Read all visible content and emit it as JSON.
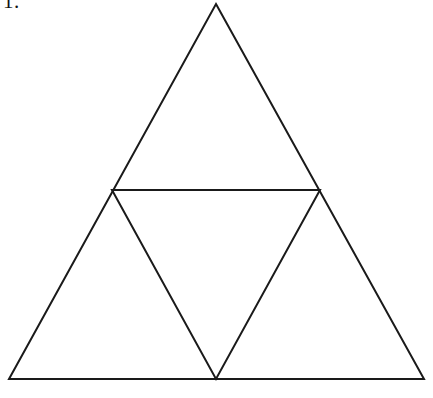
{
  "page": {
    "background_color": "#ffffff",
    "width": 433,
    "height": 398
  },
  "problem": {
    "number_label": "1."
  },
  "figure": {
    "caption": "",
    "stroke_color": "#1a1a1a",
    "fill_color": "none",
    "stroke_width": 2,
    "shapes": {
      "outer_triangle": {
        "name": "outer-triangle",
        "points": "216,4 424,379 9,379",
        "vertices": {
          "apex": "216,4",
          "bottom_left": "9,379",
          "bottom_right": "424,379"
        }
      },
      "inner_triangle": {
        "name": "inner-inverted-triangle",
        "points": "112,190 320,190 216,379",
        "vertices": {
          "top_left_midpoint": "112,190",
          "top_right_midpoint": "320,190",
          "bottom_midpoint": "216,379"
        }
      }
    }
  }
}
